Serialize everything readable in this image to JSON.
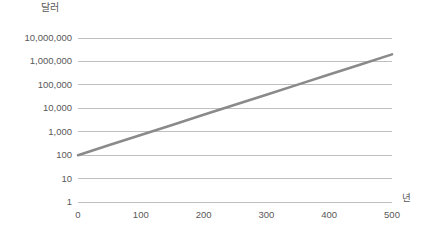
{
  "chart_data": {
    "type": "line",
    "title": "달러",
    "subtitle": "",
    "xlabel": "년",
    "ylabel": "달러",
    "yscale": "log",
    "xscale": "linear",
    "xlim": [
      0,
      500
    ],
    "ylim": [
      1,
      10000000
    ],
    "grid": "horizontal-only",
    "legend": "none",
    "xticks": [
      0,
      100,
      200,
      300,
      400,
      500
    ],
    "xtick_labels": [
      "0",
      "100",
      "200",
      "300",
      "400",
      "500"
    ],
    "yticks": [
      1,
      10,
      100,
      1000,
      10000,
      100000,
      1000000,
      10000000
    ],
    "ytick_labels": [
      "1",
      "10",
      "100",
      "1,000",
      "10,000",
      "100,000",
      "1,000,000",
      "10,000,000"
    ],
    "series": [
      {
        "name": "달러",
        "color": "#8a8a8a",
        "x": [
          0,
          50,
          100,
          150,
          200,
          250,
          300,
          350,
          400,
          450,
          500
        ],
        "values": [
          100,
          269,
          724,
          1950,
          5250,
          14130,
          38040,
          102400,
          275700,
          742300,
          1998700
        ]
      }
    ],
    "annotations": []
  },
  "style": {
    "background": "#ffffff",
    "gridline_color": "#bfbfbf",
    "text_color": "#595959",
    "line_color": "#8a8a8a"
  }
}
